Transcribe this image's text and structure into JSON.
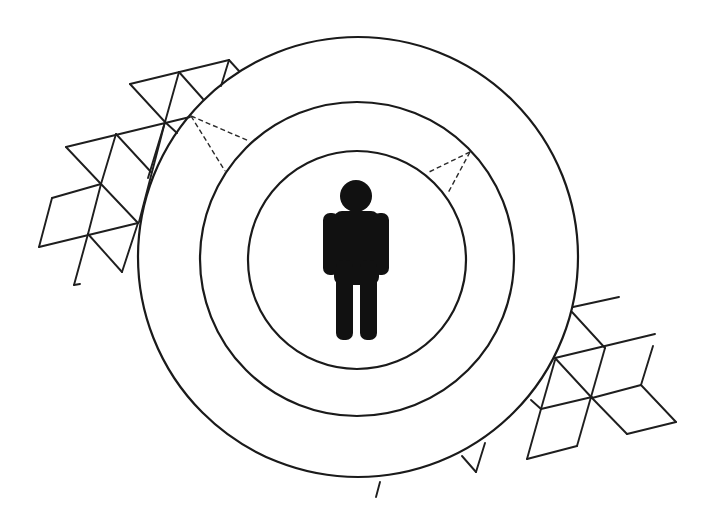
{
  "diagram": {
    "colors": {
      "stroke": "#1a1a1a",
      "figure": "#111111",
      "background": "#ffffff"
    },
    "center": {
      "x": 358,
      "y": 259
    },
    "rings": [
      {
        "name": "outer-ring",
        "r": 220
      },
      {
        "name": "middle-ring",
        "r": 158
      },
      {
        "name": "inner-ring",
        "r": 109
      }
    ],
    "central_icon": "person-icon"
  }
}
